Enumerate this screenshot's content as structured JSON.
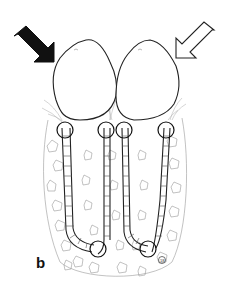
{
  "figure": {
    "panel_label": "b",
    "corner_mark": "®",
    "arrows": [
      {
        "name": "left-arrow",
        "style": "filled",
        "color": "#111111",
        "direction": "down-right"
      },
      {
        "name": "right-arrow",
        "style": "outline",
        "color": "#ffffff",
        "direction": "down-left"
      }
    ],
    "structures": {
      "bulbs": 2,
      "tubes": 4,
      "circle_markers": 6
    },
    "colors": {
      "line": "#222222",
      "tissue": "#999999",
      "background": "#ffffff"
    }
  }
}
